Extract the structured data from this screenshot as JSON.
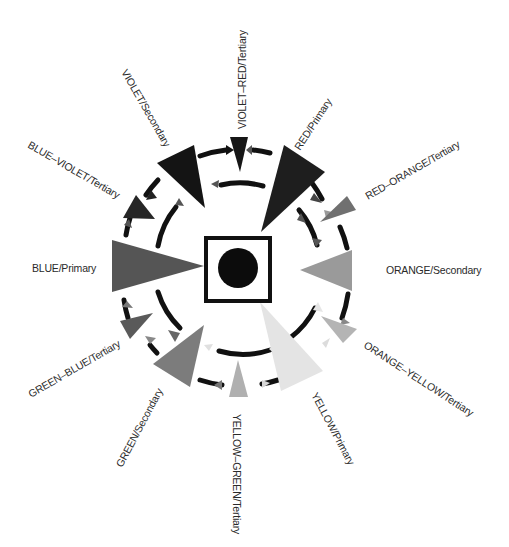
{
  "diagram": {
    "type": "color-wheel",
    "center": {
      "shape": "square-with-circle",
      "circle_color": "#0c0c0c",
      "square_border": "#111111"
    },
    "rings": [
      "outer-dashed-ring",
      "inner-dashed-ring"
    ],
    "colors": [
      {
        "id": "violet-red",
        "label": "VIOLET–RED/Tertiary",
        "shade": "#161616"
      },
      {
        "id": "red",
        "label": "RED/Primary",
        "shade": "#1e1e1e"
      },
      {
        "id": "red-orange",
        "label": "RED–ORANGE/Tertiary",
        "shade": "#707070"
      },
      {
        "id": "orange",
        "label": "ORANGE/Secondary",
        "shade": "#9a9a9a"
      },
      {
        "id": "orange-yellow",
        "label": "ORANGE–YELLOW/Tertiary",
        "shade": "#b4b4b4"
      },
      {
        "id": "yellow",
        "label": "YELLOW/Primary",
        "shade": "#e4e4e4"
      },
      {
        "id": "yellow-green",
        "label": "YELLOW–GREEN/Tertiary",
        "shade": "#b0b0b0"
      },
      {
        "id": "green",
        "label": "GREEN/Secondary",
        "shade": "#7c7c7c"
      },
      {
        "id": "green-blue",
        "label": "GREEN–BLUE/Tertiary",
        "shade": "#5a5a5a"
      },
      {
        "id": "blue",
        "label": "BLUE/Primary",
        "shade": "#555555"
      },
      {
        "id": "blue-violet",
        "label": "BLUE–VIOLET/Tertiary",
        "shade": "#262626"
      },
      {
        "id": "violet",
        "label": "VIOLET/Secondary",
        "shade": "#141414"
      }
    ]
  }
}
